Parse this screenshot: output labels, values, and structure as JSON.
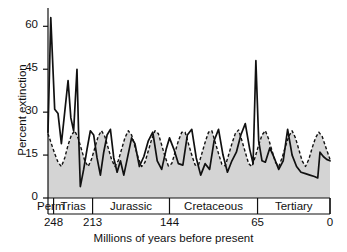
{
  "chart_data": {
    "type": "line",
    "title": "",
    "xlabel": "Millions of years before present",
    "ylabel": "Percent extinction",
    "xlim": [
      253,
      0
    ],
    "ylim": [
      0,
      65
    ],
    "x_reversed": true,
    "grid": false,
    "legend_position": "none",
    "y_ticks": [
      "0",
      "15",
      "30",
      "45",
      "60"
    ],
    "y_tick_values": [
      0,
      15,
      30,
      45,
      60
    ],
    "x_ticks": [
      "248",
      "213",
      "144",
      "65",
      "0"
    ],
    "x_tick_values": [
      248,
      213,
      144,
      65,
      0
    ],
    "period_bands": [
      {
        "label": "Perm",
        "start": 253,
        "end": 248
      },
      {
        "label": "Trias",
        "start": 248,
        "end": 213
      },
      {
        "label": "Jurassic",
        "start": 213,
        "end": 144
      },
      {
        "label": "Cretaceous",
        "start": 144,
        "end": 65
      },
      {
        "label": "Tertiary",
        "start": 65,
        "end": 0
      }
    ],
    "series": [
      {
        "name": "Observed percent extinction",
        "style": "solid",
        "color": "#111111",
        "points": [
          [
            253.0,
            23.0
          ],
          [
            250.5,
            63.0
          ],
          [
            247.0,
            31.0
          ],
          [
            244.0,
            29.5
          ],
          [
            241.0,
            19.0
          ],
          [
            238.0,
            30.0
          ],
          [
            235.0,
            41.0
          ],
          [
            232.5,
            28.0
          ],
          [
            230.0,
            23.5
          ],
          [
            227.0,
            45.0
          ],
          [
            225.5,
            22.0
          ],
          [
            224.0,
            4.0
          ],
          [
            221.0,
            10.0
          ],
          [
            218.0,
            17.0
          ],
          [
            215.0,
            23.5
          ],
          [
            212.0,
            22.0
          ],
          [
            209.0,
            14.0
          ],
          [
            206.0,
            8.0
          ],
          [
            203.0,
            16.0
          ],
          [
            200.0,
            22.0
          ],
          [
            197.0,
            24.0
          ],
          [
            194.0,
            14.0
          ],
          [
            191.0,
            9.0
          ],
          [
            188.0,
            13.0
          ],
          [
            185.0,
            8.0
          ],
          [
            182.0,
            13.5
          ],
          [
            178.0,
            21.0
          ],
          [
            175.0,
            19.0
          ],
          [
            171.0,
            11.0
          ],
          [
            167.0,
            14.5
          ],
          [
            163.0,
            20.0
          ],
          [
            159.0,
            23.0
          ],
          [
            155.0,
            13.0
          ],
          [
            151.0,
            10.0
          ],
          [
            147.0,
            17.0
          ],
          [
            144.0,
            21.0
          ],
          [
            140.0,
            17.0
          ],
          [
            136.0,
            12.0
          ],
          [
            132.0,
            11.5
          ],
          [
            128.0,
            22.0
          ],
          [
            124.0,
            24.0
          ],
          [
            120.0,
            14.0
          ],
          [
            116.0,
            8.0
          ],
          [
            112.0,
            12.0
          ],
          [
            108.0,
            10.0
          ],
          [
            104.0,
            20.0
          ],
          [
            100.0,
            24.0
          ],
          [
            96.0,
            15.0
          ],
          [
            92.0,
            9.0
          ],
          [
            88.0,
            13.0
          ],
          [
            84.0,
            16.0
          ],
          [
            80.0,
            22.0
          ],
          [
            76.0,
            26.0
          ],
          [
            72.0,
            17.0
          ],
          [
            69.0,
            12.0
          ],
          [
            66.5,
            48.0
          ],
          [
            64.0,
            20.0
          ],
          [
            61.0,
            13.0
          ],
          [
            58.0,
            12.5
          ],
          [
            54.0,
            17.5
          ],
          [
            50.0,
            14.0
          ],
          [
            46.0,
            10.0
          ],
          [
            42.0,
            13.0
          ],
          [
            38.0,
            24.0
          ],
          [
            34.0,
            15.0
          ],
          [
            30.0,
            11.0
          ],
          [
            26.0,
            9.0
          ],
          [
            22.0,
            8.5
          ],
          [
            18.0,
            8.0
          ],
          [
            14.0,
            7.5
          ],
          [
            11.0,
            7.0
          ],
          [
            9.0,
            16.0
          ],
          [
            6.0,
            14.5
          ],
          [
            3.0,
            13.5
          ],
          [
            0.0,
            13.0
          ]
        ]
      },
      {
        "name": "Fitted 26-million-year periodic cycle",
        "style": "dashed",
        "color": "#111111",
        "fill": "#d4d4d4",
        "points": [
          [
            253.0,
            22.5
          ],
          [
            250.0,
            19.0
          ],
          [
            247.0,
            15.5
          ],
          [
            244.0,
            12.5
          ],
          [
            241.0,
            11.0
          ],
          [
            238.0,
            14.0
          ],
          [
            235.0,
            18.5
          ],
          [
            232.0,
            22.0
          ],
          [
            229.0,
            23.5
          ],
          [
            226.0,
            21.0
          ],
          [
            223.0,
            17.0
          ],
          [
            220.0,
            13.0
          ],
          [
            217.0,
            11.0
          ],
          [
            214.0,
            13.5
          ],
          [
            211.0,
            17.5
          ],
          [
            208.0,
            21.5
          ],
          [
            205.0,
            23.5
          ],
          [
            202.0,
            21.5
          ],
          [
            199.0,
            17.5
          ],
          [
            196.0,
            13.5
          ],
          [
            193.0,
            11.0
          ],
          [
            190.0,
            13.0
          ],
          [
            187.0,
            17.0
          ],
          [
            184.0,
            21.0
          ],
          [
            181.0,
            23.5
          ],
          [
            178.0,
            22.0
          ],
          [
            175.0,
            18.0
          ],
          [
            172.0,
            14.0
          ],
          [
            169.0,
            11.0
          ],
          [
            166.0,
            12.5
          ],
          [
            163.0,
            16.5
          ],
          [
            160.0,
            20.5
          ],
          [
            157.0,
            23.5
          ],
          [
            154.0,
            22.5
          ],
          [
            151.0,
            18.5
          ],
          [
            148.0,
            14.5
          ],
          [
            145.0,
            11.2
          ],
          [
            142.0,
            12.0
          ],
          [
            139.0,
            16.0
          ],
          [
            136.0,
            20.0
          ],
          [
            133.0,
            23.0
          ],
          [
            130.0,
            23.0
          ],
          [
            127.0,
            19.0
          ],
          [
            124.0,
            15.0
          ],
          [
            121.0,
            11.5
          ],
          [
            118.0,
            11.5
          ],
          [
            115.0,
            15.5
          ],
          [
            112.0,
            19.5
          ],
          [
            109.0,
            23.0
          ],
          [
            106.0,
            23.5
          ],
          [
            103.0,
            19.5
          ],
          [
            100.0,
            15.5
          ],
          [
            97.0,
            11.8
          ],
          [
            94.0,
            11.2
          ],
          [
            91.0,
            15.0
          ],
          [
            88.0,
            19.0
          ],
          [
            85.0,
            22.5
          ],
          [
            82.0,
            23.8
          ],
          [
            79.0,
            20.0
          ],
          [
            76.0,
            16.0
          ],
          [
            73.0,
            12.0
          ],
          [
            70.0,
            11.0
          ],
          [
            67.0,
            14.5
          ],
          [
            64.0,
            18.5
          ],
          [
            61.0,
            22.0
          ],
          [
            58.0,
            23.5
          ],
          [
            55.0,
            20.5
          ],
          [
            52.0,
            16.5
          ],
          [
            49.0,
            12.5
          ],
          [
            46.0,
            11.0
          ],
          [
            43.0,
            14.0
          ],
          [
            40.0,
            18.0
          ],
          [
            37.0,
            21.5
          ],
          [
            34.0,
            23.5
          ],
          [
            31.0,
            21.0
          ],
          [
            28.0,
            17.0
          ],
          [
            25.0,
            13.0
          ],
          [
            22.0,
            11.0
          ],
          [
            19.0,
            13.5
          ],
          [
            16.0,
            17.5
          ],
          [
            13.0,
            21.0
          ],
          [
            10.0,
            23.0
          ],
          [
            7.0,
            21.5
          ],
          [
            4.0,
            18.0
          ],
          [
            0.0,
            13.5
          ]
        ]
      }
    ]
  },
  "axes": {
    "y_label": "Percent extinction",
    "x_label": "Millions of years before present"
  }
}
